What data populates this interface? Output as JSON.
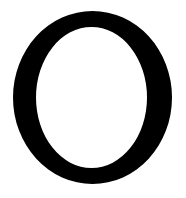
{
  "glyph": {
    "character": "O",
    "color": "#000000",
    "background": "#ffffff"
  }
}
